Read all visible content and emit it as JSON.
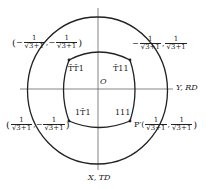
{
  "diagram": {
    "axes": {
      "horizontal_label": "Y, RD",
      "vertical_label": "X, TD",
      "origin_label": "O"
    },
    "region_labels": {
      "upper_left": "T̄T̄1",
      "upper_right": "T̄11",
      "lower_left": "1T̄1",
      "lower_right": "111"
    },
    "points": {
      "upper_left": {
        "prefix": "(",
        "x_sign": "−",
        "x_num": "1",
        "x_den": "√3+1",
        "y_sign": "−",
        "y_num": "1",
        "y_den": "√3+1",
        "suffix": ")"
      },
      "upper_right": {
        "prefix": "",
        "x_sign": "−",
        "x_num": "1",
        "x_den": "√3+1",
        "y_sign": "",
        "y_num": "1",
        "y_den": "√3+1",
        "suffix": ""
      },
      "lower_left": {
        "prefix": "(",
        "x_sign": "",
        "x_num": "1",
        "x_den": "√3+1",
        "y_sign": "−",
        "y_num": "1",
        "y_den": "√3+1",
        "suffix": ")"
      },
      "lower_right": {
        "prefix": "P′(",
        "x_sign": "",
        "x_num": "1",
        "x_den": "√3+1",
        "y_sign": "",
        "y_num": "1",
        "y_den": "√3+1",
        "suffix": ")"
      }
    },
    "colors": {
      "stroke": "#222222",
      "axis": "#555555",
      "background": "#ffffff"
    }
  }
}
